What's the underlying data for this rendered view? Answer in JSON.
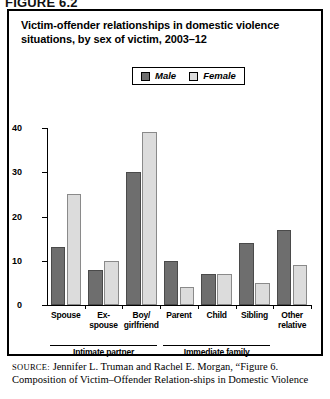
{
  "figure_header": "FIGURE 6.2",
  "title": "Victim-offender relationships in domestic violence situations, by sex of victim, 2003–12",
  "legend": {
    "position": "top-center",
    "items": [
      {
        "label": "Male",
        "color": "#6e6e6e"
      },
      {
        "label": "Female",
        "color": "#dcdcdc"
      }
    ]
  },
  "axis": {
    "y_title": "Percent",
    "y_ticks": [
      "0",
      "10",
      "20",
      "30",
      "40"
    ]
  },
  "groups": [
    {
      "label": "Intimate partner",
      "categories": [
        "Spouse",
        "Ex-spouse",
        "Boy/girlfriend"
      ]
    },
    {
      "label": "Immediate family",
      "categories": [
        "Parent",
        "Child",
        "Sibling"
      ]
    }
  ],
  "source": {
    "label": "SOURCE:",
    "text": " Jennifer L. Truman and Rachel E. Morgan, “Figure 6. Composition of Victim–Offender Relation-ships in Domestic Violence"
  },
  "chart_data": {
    "type": "bar",
    "title": "Victim-offender relationships in domestic violence situations, by sex of victim, 2003–12",
    "xlabel": "",
    "ylabel": "Percent",
    "ylim": [
      0,
      40
    ],
    "yticks": [
      0,
      10,
      20,
      30,
      40
    ],
    "grid": false,
    "legend_position": "top-center",
    "categories": [
      "Spouse",
      "Ex-spouse",
      "Boy/girlfriend",
      "Parent",
      "Child",
      "Sibling",
      "Other relative"
    ],
    "category_lines": [
      [
        "Spouse"
      ],
      [
        "Ex-",
        "spouse"
      ],
      [
        "Boy/",
        "girlfriend"
      ],
      [
        "Parent"
      ],
      [
        "Child"
      ],
      [
        "Sibling"
      ],
      [
        "Other",
        "relative"
      ]
    ],
    "series": [
      {
        "name": "Male",
        "color": "#6e6e6e",
        "values": [
          13,
          8,
          30,
          10,
          7,
          14,
          17
        ]
      },
      {
        "name": "Female",
        "color": "#dcdcdc",
        "values": [
          25,
          10,
          39,
          4,
          7,
          5,
          9
        ]
      }
    ],
    "group_annotations": [
      {
        "label": "Intimate partner",
        "spans": [
          "Spouse",
          "Ex-spouse",
          "Boy/girlfriend"
        ]
      },
      {
        "label": "Immediate family",
        "spans": [
          "Parent",
          "Child",
          "Sibling"
        ]
      }
    ]
  }
}
